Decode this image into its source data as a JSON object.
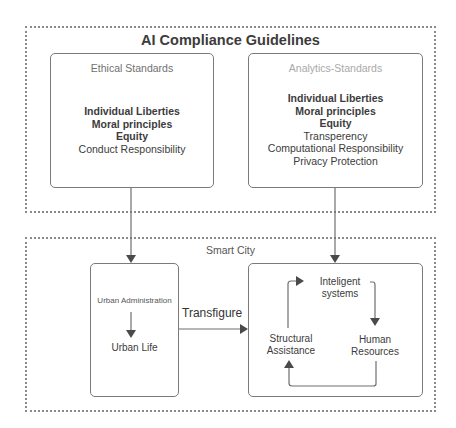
{
  "diagram": {
    "title": "AI Compliance Guidelines",
    "ethical": {
      "heading": "Ethical Standards",
      "items": [
        {
          "text": "Individual Liberties",
          "bold": true
        },
        {
          "text": "Moral principles",
          "bold": true
        },
        {
          "text": "Equity",
          "bold": true
        },
        {
          "text": "Conduct Responsibility",
          "bold": false
        }
      ]
    },
    "analytics": {
      "heading": "Analytics-Standards",
      "items": [
        {
          "text": "Individual Liberties",
          "bold": true
        },
        {
          "text": "Moral principles",
          "bold": true
        },
        {
          "text": "Equity",
          "bold": true
        },
        {
          "text": "Transperency",
          "bold": false
        },
        {
          "text": "Computational Responsibility",
          "bold": false
        },
        {
          "text": "Privacy Protection",
          "bold": false
        }
      ]
    },
    "smart_city": {
      "label": "Smart City",
      "urban": {
        "top": "Urban Administration",
        "bottom": "Urban Life"
      },
      "connector_label": "Transfigure",
      "cycle": {
        "top": "Inteligent systems",
        "top_line1": "Inteligent",
        "top_line2": "systems",
        "right_line1": "Human",
        "right_line2": "Resources",
        "left_line1": "Structural",
        "left_line2": "Assistance"
      }
    },
    "colors": {
      "line": "#6f6f6f",
      "arrowhead": "#4a4a4a",
      "text": "#3c3c3c",
      "dotted_border": "#8a8a8a"
    }
  }
}
